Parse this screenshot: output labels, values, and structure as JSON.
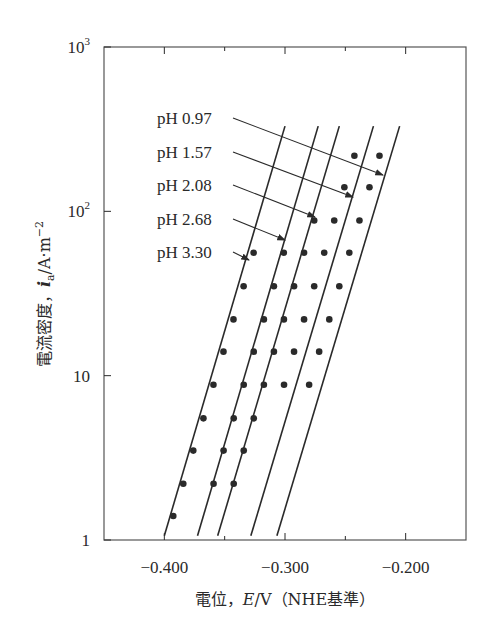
{
  "chart_data": {
    "type": "line",
    "title": "",
    "xlabel": "電位, E/V (NHE基準)",
    "ylabel": "電流密度, i_a/A·m⁻²",
    "xlabel_parts": {
      "prefix": "電位，",
      "var": "E",
      "unit": "/V",
      "suffix": "（NHE基準）"
    },
    "ylabel_parts": {
      "prefix": "電流密度，",
      "var": "i",
      "sub": "a",
      "unit": "/A·m",
      "sup": "−2"
    },
    "x_scale": "linear",
    "y_scale": "log",
    "xlim": [
      -0.45,
      -0.15
    ],
    "ylim": [
      1,
      1000
    ],
    "x_ticks": [
      -0.4,
      -0.35,
      -0.3,
      -0.25,
      -0.2
    ],
    "x_tick_labels": [
      "−0.400",
      "",
      "−0.300",
      "",
      "−0.200"
    ],
    "y_ticks": [
      1,
      10,
      100,
      1000
    ],
    "y_tick_labels": [
      "1",
      "10",
      "10^2",
      "10^3"
    ],
    "grid": false,
    "legend": "annotations with arrows",
    "series": [
      {
        "name": "pH 3.30",
        "line": {
          "x": [
            -0.4,
            -0.3
          ],
          "y": [
            1.06,
            330
          ]
        },
        "points": {
          "x": [
            -0.3926,
            -0.3843,
            -0.376,
            -0.3676,
            -0.3593,
            -0.351,
            -0.3427,
            -0.3343,
            -0.326
          ],
          "y": [
            1.4,
            2.2,
            3.5,
            5.5,
            8.8,
            14,
            22,
            35,
            56
          ]
        }
      },
      {
        "name": "pH 2.68",
        "line": {
          "x": [
            -0.3725,
            -0.2725
          ],
          "y": [
            1.06,
            330
          ]
        },
        "points": {
          "x": [
            -0.3592,
            -0.3509,
            -0.3425,
            -0.3342,
            -0.3259,
            -0.3175,
            -0.3092,
            -0.301
          ],
          "y": [
            2.2,
            3.5,
            5.5,
            8.8,
            14,
            22,
            35,
            56
          ]
        }
      },
      {
        "name": "pH 2.08",
        "line": {
          "x": [
            -0.3558,
            -0.255
          ],
          "y": [
            1.06,
            330
          ]
        },
        "points": {
          "x": [
            -0.3425,
            -0.3342,
            -0.3259,
            -0.3175,
            -0.3092,
            -0.3009,
            -0.2925,
            -0.2842,
            -0.2758
          ],
          "y": [
            2.2,
            3.5,
            5.5,
            8.8,
            14,
            22,
            35,
            56,
            88
          ]
        }
      },
      {
        "name": "pH 1.57",
        "line": {
          "x": [
            -0.3283,
            -0.2267
          ],
          "y": [
            1.06,
            330
          ]
        },
        "points": {
          "x": [
            -0.3008,
            -0.2925,
            -0.2842,
            -0.2758,
            -0.2675,
            -0.2592,
            -0.2508,
            -0.2425
          ],
          "y": [
            8.8,
            14,
            22,
            35,
            56,
            88,
            140,
            218
          ]
        }
      },
      {
        "name": "pH 0.97",
        "line": {
          "x": [
            -0.3067,
            -0.205
          ],
          "y": [
            1.06,
            330
          ]
        },
        "points": {
          "x": [
            -0.28,
            -0.2717,
            -0.2633,
            -0.255,
            -0.2467,
            -0.2383,
            -0.23,
            -0.2217
          ],
          "y": [
            8.8,
            14,
            22,
            35,
            56,
            88,
            140,
            218
          ]
        }
      }
    ]
  },
  "annotations": [
    {
      "label": "pH 0.97",
      "y": 118,
      "tip": [
        383,
        175
      ]
    },
    {
      "label": "pH 1.57",
      "y": 152,
      "tip": [
        353,
        197
      ]
    },
    {
      "label": "pH 2.08",
      "y": 185,
      "tip": [
        315,
        217
      ]
    },
    {
      "label": "pH 2.68",
      "y": 219,
      "tip": [
        285,
        240
      ]
    },
    {
      "label": "pH 3.30",
      "y": 252,
      "tip": [
        249,
        260
      ]
    }
  ],
  "colors": {
    "ink": "#2a2a2a",
    "background": "#ffffff"
  }
}
